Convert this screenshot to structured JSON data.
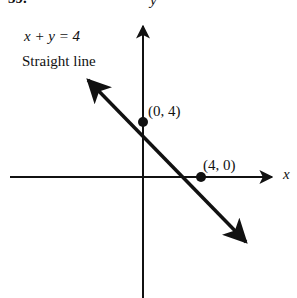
{
  "problem_number": "39.",
  "equation": "x + y = 4",
  "description": "Straight line",
  "axes": {
    "x_label": "x",
    "y_label": "y"
  },
  "points": [
    {
      "label": "(0, 4)",
      "x": 0,
      "y": 4
    },
    {
      "label": "(4, 0)",
      "x": 4,
      "y": 0
    }
  ],
  "colors": {
    "ink": "#111111",
    "background": "#ffffff"
  }
}
